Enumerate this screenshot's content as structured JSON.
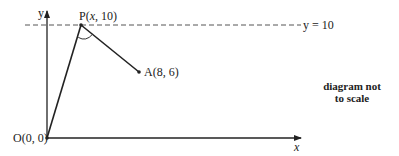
{
  "diagram": {
    "axes": {
      "x_label": "x",
      "y_label": "y"
    },
    "horizontal_line": {
      "label": "y = 10",
      "style": "dashed"
    },
    "points": [
      {
        "id": "O",
        "label": "O(0, 0)"
      },
      {
        "id": "P",
        "label_prefix": "P(",
        "label_var": "x",
        "label_suffix": ", 10)"
      },
      {
        "id": "A",
        "label": "A(8, 6)"
      }
    ],
    "segments": [
      "OP",
      "PA"
    ],
    "angle_marked_at": "P",
    "note_line1": "diagram not",
    "note_line2": "to scale"
  }
}
